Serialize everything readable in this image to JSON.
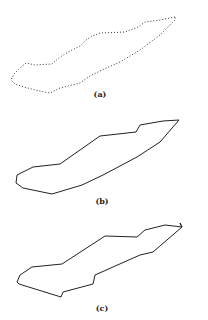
{
  "figure": {
    "panels": [
      {
        "label": "(a)",
        "style": "dotted",
        "label_pos": [
          100,
          89
        ],
        "points": [
          [
            175,
            17
          ],
          [
            160,
            20
          ],
          [
            145,
            22
          ],
          [
            138,
            27
          ],
          [
            125,
            32
          ],
          [
            100,
            33
          ],
          [
            92,
            36
          ],
          [
            86,
            40
          ],
          [
            80,
            46
          ],
          [
            70,
            51
          ],
          [
            60,
            57
          ],
          [
            52,
            64
          ],
          [
            35,
            65
          ],
          [
            26,
            63
          ],
          [
            20,
            68
          ],
          [
            14,
            74
          ],
          [
            11,
            80
          ],
          [
            15,
            84
          ],
          [
            24,
            87
          ],
          [
            35,
            90
          ],
          [
            50,
            93
          ],
          [
            60,
            88
          ],
          [
            80,
            83
          ],
          [
            90,
            76
          ],
          [
            100,
            71
          ],
          [
            120,
            62
          ],
          [
            140,
            50
          ],
          [
            160,
            35
          ],
          [
            175,
            20
          ]
        ]
      },
      {
        "label": "(b)",
        "style": "solid",
        "label_pos": [
          102,
          196
        ],
        "points": [
          [
            179,
            120
          ],
          [
            163,
            121
          ],
          [
            140,
            125
          ],
          [
            136,
            132
          ],
          [
            100,
            136
          ],
          [
            60,
            164
          ],
          [
            33,
            167
          ],
          [
            17,
            175
          ],
          [
            16,
            183
          ],
          [
            23,
            188
          ],
          [
            52,
            194
          ],
          [
            82,
            185
          ],
          [
            103,
            175
          ],
          [
            137,
            157
          ],
          [
            160,
            142
          ],
          [
            179,
            120
          ]
        ]
      },
      {
        "label": "(c)",
        "style": "solid",
        "label_pos": [
          102,
          303
        ],
        "points": [
          [
            180,
            223
          ],
          [
            182,
            227
          ],
          [
            165,
            225
          ],
          [
            145,
            230
          ],
          [
            137,
            237
          ],
          [
            105,
            236
          ],
          [
            62,
            264
          ],
          [
            32,
            267
          ],
          [
            20,
            275
          ],
          [
            17,
            282
          ],
          [
            19,
            284
          ],
          [
            61,
            297
          ],
          [
            63,
            292
          ],
          [
            93,
            284
          ],
          [
            95,
            275
          ],
          [
            140,
            255
          ],
          [
            153,
            252
          ],
          [
            182,
            227
          ]
        ]
      }
    ]
  }
}
